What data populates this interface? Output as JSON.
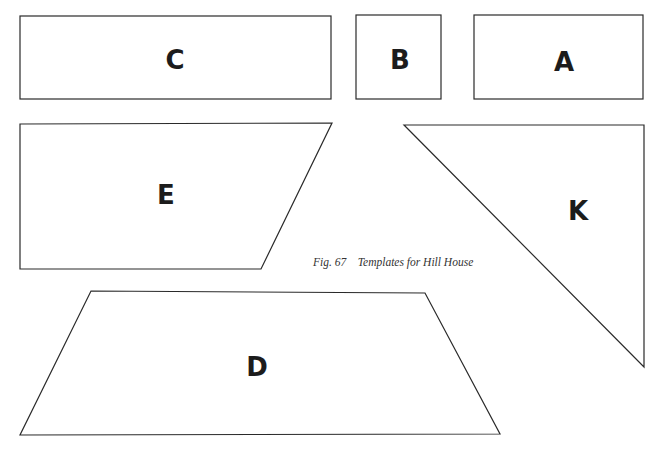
{
  "figure": {
    "caption": "Fig. 67    Templates for Hill House",
    "templates": [
      {
        "id": "C",
        "label": "C",
        "shape": "rectangle"
      },
      {
        "id": "B",
        "label": "B",
        "shape": "square"
      },
      {
        "id": "A",
        "label": "A",
        "shape": "rectangle"
      },
      {
        "id": "E",
        "label": "E",
        "shape": "right trapezoid"
      },
      {
        "id": "K",
        "label": "K",
        "shape": "right triangle"
      },
      {
        "id": "D",
        "label": "D",
        "shape": "trapezoid"
      }
    ]
  }
}
